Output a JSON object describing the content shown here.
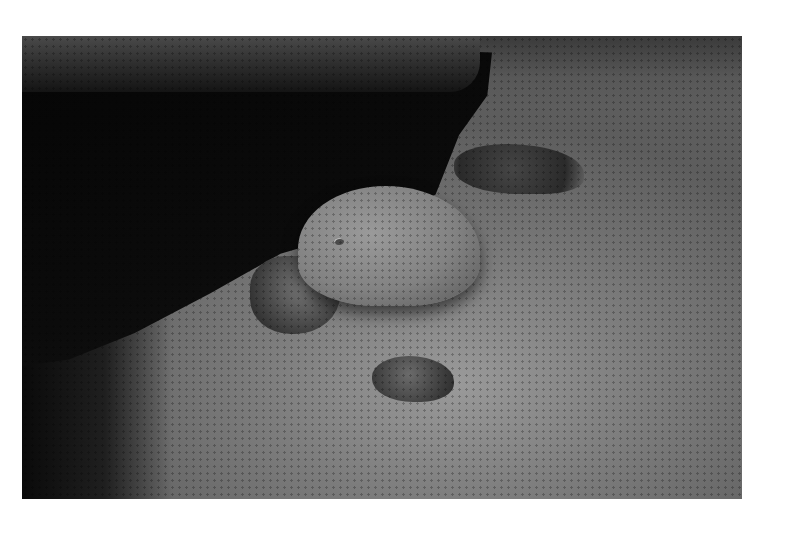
{
  "image": {
    "subject": "nurse shark resting under a rocky ledge on sandy seafloor",
    "tone": "black-and-white",
    "colors": {
      "background": "#ffffff",
      "shadow": "#0b0b0b",
      "sand": "#8a8a8a",
      "shark": "#8f8f8f"
    }
  }
}
